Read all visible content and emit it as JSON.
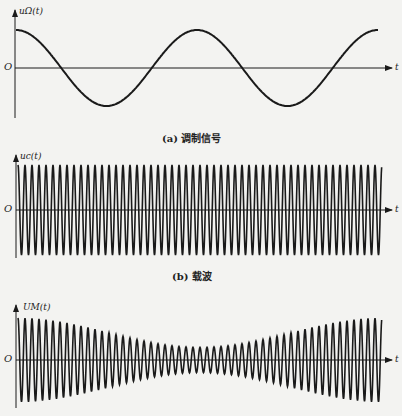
{
  "panels": [
    {
      "id": "a",
      "ylabel": "uΩ(t)",
      "origin": "O",
      "xlabel": "t",
      "caption": "(a) 调制信号"
    },
    {
      "id": "b",
      "ylabel": "uc(t)",
      "origin": "O",
      "xlabel": "t",
      "caption": "(b) 载波"
    },
    {
      "id": "c",
      "ylabel": "UM(t)",
      "origin": "O",
      "xlabel": "t",
      "caption": ""
    }
  ],
  "chart_data": [
    {
      "type": "line",
      "title": "(a) 调制信号",
      "ylabel": "uΩ(t)",
      "xlabel": "t",
      "description": "Modulating signal: cosine wave starting at positive maximum, ~2 periods shown",
      "periods": 2,
      "amplitude": 1
    },
    {
      "type": "line",
      "title": "(b) 载波",
      "ylabel": "uc(t)",
      "xlabel": "t",
      "description": "Carrier: high-frequency constant-amplitude sinusoid",
      "cycles": 52,
      "amplitude": 1
    },
    {
      "type": "line",
      "title": "",
      "ylabel": "UM(t)",
      "xlabel": "t",
      "description": "AM wave: carrier with envelope following the modulating signal",
      "cycles": 52,
      "envelope_max": 1,
      "envelope_min": 0.3
    }
  ]
}
